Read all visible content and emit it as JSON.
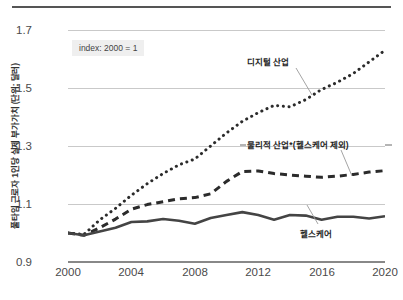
{
  "chart_data": {
    "type": "line",
    "title": "",
    "subtitle": "",
    "xlabel": "",
    "ylabel": "풀타임 근로자 1인당 실제 부가가치 (단위: 달러)",
    "annotation": "index: 2000 = 1",
    "xlim": [
      2000,
      2020
    ],
    "ylim": [
      0.9,
      1.7
    ],
    "xticks": [
      "2000",
      "2004",
      "2008",
      "2012",
      "2016",
      "2020"
    ],
    "yticks": [
      "0.9",
      "1.1",
      "1.3",
      "1.5",
      "1.7"
    ],
    "grid": true,
    "legend_position": "inline-annotations",
    "x": [
      2000,
      2001,
      2002,
      2003,
      2004,
      2005,
      2006,
      2007,
      2008,
      2009,
      2010,
      2011,
      2012,
      2013,
      2014,
      2015,
      2016,
      2017,
      2018,
      2019,
      2020
    ],
    "series": [
      {
        "name": "디지털 산업",
        "style": "dotted",
        "color": "#2b2b2b",
        "values": [
          1.0,
          0.995,
          1.045,
          1.085,
          1.13,
          1.17,
          1.205,
          1.235,
          1.255,
          1.3,
          1.345,
          1.385,
          1.415,
          1.44,
          1.435,
          1.46,
          1.495,
          1.52,
          1.55,
          1.59,
          1.63
        ]
      },
      {
        "name": "물리적 산업*(헬스케어 제외)",
        "style": "dashed",
        "color": "#2b2b2b",
        "values": [
          1.0,
          0.992,
          1.018,
          1.048,
          1.082,
          1.098,
          1.108,
          1.118,
          1.122,
          1.135,
          1.178,
          1.212,
          1.214,
          1.205,
          1.2,
          1.196,
          1.192,
          1.196,
          1.202,
          1.21,
          1.215
        ]
      },
      {
        "name": "헬스케어",
        "style": "solid",
        "color": "#444444",
        "values": [
          1.0,
          0.992,
          1.005,
          1.018,
          1.038,
          1.04,
          1.048,
          1.042,
          1.032,
          1.052,
          1.062,
          1.072,
          1.062,
          1.046,
          1.062,
          1.06,
          1.046,
          1.056,
          1.056,
          1.05,
          1.058
        ]
      }
    ]
  },
  "labels": {
    "digital": "디지털 산업",
    "physical": "물리적 산업*(헬스케어 제외)",
    "healthcare": "헬스케어",
    "index_note": "index: 2000 = 1",
    "y_axis_title": "풀타임 근로자 1인당 실제 부가가치 (단위: 달러)"
  },
  "colors": {
    "gridline": "#c9c9c9",
    "axis": "#888888",
    "ink": "#2b2b2b",
    "note_bg": "#efefef",
    "background": "#ffffff"
  }
}
